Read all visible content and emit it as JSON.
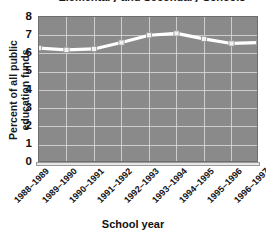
{
  "chart_data": {
    "type": "line",
    "title": "Elementary and Secondary Schools",
    "xlabel": "School year",
    "ylabel": "Percent of all public education funds",
    "categories": [
      "1988–1989",
      "1989–1990",
      "1990–1991",
      "1991–1992",
      "1992–1993",
      "1993–1994",
      "1994–1995",
      "1995–1996",
      "1996–1997"
    ],
    "values": [
      6.3,
      6.2,
      6.25,
      6.6,
      7.0,
      7.1,
      6.8,
      6.55,
      6.6
    ],
    "ylim": [
      0,
      8
    ],
    "yticks": [
      "0",
      "1",
      "2",
      "3",
      "4",
      "5",
      "6",
      "7",
      "8"
    ],
    "grid": true,
    "legend": "none",
    "series_color": "#ffffff",
    "plot_background": "#8a8a8a",
    "gridline_color": "#d8d8d8",
    "marker": "square"
  }
}
